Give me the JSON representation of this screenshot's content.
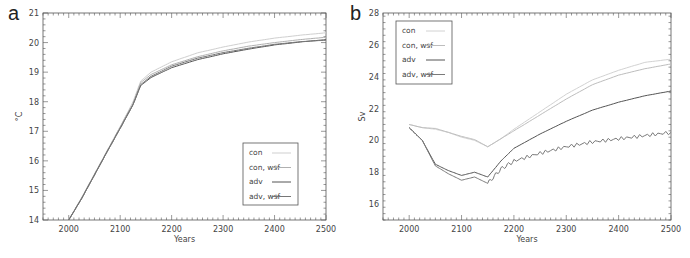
{
  "chart_data": [
    {
      "panel": "a",
      "type": "line",
      "title": "",
      "xlabel": "Years",
      "ylabel": "°C",
      "xlim": [
        1950,
        2500
      ],
      "ylim": [
        14,
        21
      ],
      "xticks": [
        2000,
        2100,
        2200,
        2300,
        2400,
        2500
      ],
      "yticks": [
        14,
        15,
        16,
        17,
        18,
        19,
        20,
        21
      ],
      "grid": false,
      "legend_position": "lower right",
      "x": [
        2000,
        2025,
        2050,
        2075,
        2100,
        2125,
        2140,
        2160,
        2200,
        2250,
        2300,
        2350,
        2400,
        2450,
        2500
      ],
      "series": [
        {
          "name": "con",
          "color": "#cfcfcf",
          "values": [
            14.0,
            14.75,
            15.55,
            16.35,
            17.15,
            18.0,
            18.7,
            19.0,
            19.35,
            19.65,
            19.85,
            20.02,
            20.15,
            20.25,
            20.33
          ]
        },
        {
          "name": "con, wsf",
          "color": "#b0b0b0",
          "values": [
            14.0,
            14.75,
            15.55,
            16.35,
            17.15,
            17.95,
            18.65,
            18.92,
            19.25,
            19.52,
            19.72,
            19.88,
            20.0,
            20.1,
            20.18
          ]
        },
        {
          "name": "adv",
          "color": "#555555",
          "values": [
            14.0,
            14.72,
            15.52,
            16.32,
            17.1,
            17.9,
            18.55,
            18.82,
            19.15,
            19.42,
            19.62,
            19.78,
            19.92,
            20.02,
            20.1
          ]
        },
        {
          "name": "adv, wsf",
          "color": "#777777",
          "values": [
            14.0,
            14.72,
            15.52,
            16.32,
            17.1,
            17.9,
            18.58,
            18.86,
            19.2,
            19.47,
            19.66,
            19.81,
            19.94,
            20.03,
            20.08
          ]
        }
      ]
    },
    {
      "panel": "b",
      "type": "line",
      "title": "",
      "xlabel": "Years",
      "ylabel": "Sv",
      "xlim": [
        1950,
        2500
      ],
      "ylim": [
        15,
        28
      ],
      "xticks": [
        2000,
        2100,
        2200,
        2300,
        2400,
        2500
      ],
      "yticks": [
        16,
        18,
        20,
        22,
        24,
        26,
        28
      ],
      "grid": false,
      "legend_position": "upper left",
      "x": [
        2000,
        2025,
        2050,
        2075,
        2100,
        2125,
        2150,
        2175,
        2200,
        2250,
        2300,
        2350,
        2400,
        2450,
        2500
      ],
      "series": [
        {
          "name": "con",
          "color": "#d2d2d2",
          "values": [
            21.0,
            20.8,
            20.7,
            20.5,
            20.2,
            20.0,
            19.6,
            20.1,
            20.7,
            21.8,
            22.9,
            23.8,
            24.4,
            24.9,
            25.1
          ]
        },
        {
          "name": "con, wsf",
          "color": "#bdbdbd",
          "values": [
            21.0,
            20.8,
            20.75,
            20.5,
            20.25,
            20.05,
            19.6,
            20.1,
            20.6,
            21.6,
            22.6,
            23.5,
            24.1,
            24.5,
            24.8
          ]
        },
        {
          "name": "adv",
          "color": "#555555",
          "values": [
            20.8,
            20.0,
            18.5,
            18.1,
            17.8,
            18.0,
            17.7,
            18.7,
            19.5,
            20.4,
            21.2,
            21.9,
            22.4,
            22.8,
            23.1
          ]
        },
        {
          "name": "adv, wsf",
          "color": "#7a7a7a",
          "values": [
            20.8,
            20.0,
            18.4,
            17.9,
            17.5,
            17.7,
            17.3,
            18.2,
            18.7,
            19.2,
            19.6,
            19.9,
            20.1,
            20.3,
            20.5
          ]
        }
      ]
    }
  ],
  "panels": {
    "a": {
      "letter": "a",
      "ylabel": "°C",
      "xlabel": "Years"
    },
    "b": {
      "letter": "b",
      "ylabel": "Sv",
      "xlabel": "Years"
    }
  },
  "legend": {
    "items": [
      "con",
      "con, wsf",
      "adv",
      "adv, wsf"
    ]
  }
}
